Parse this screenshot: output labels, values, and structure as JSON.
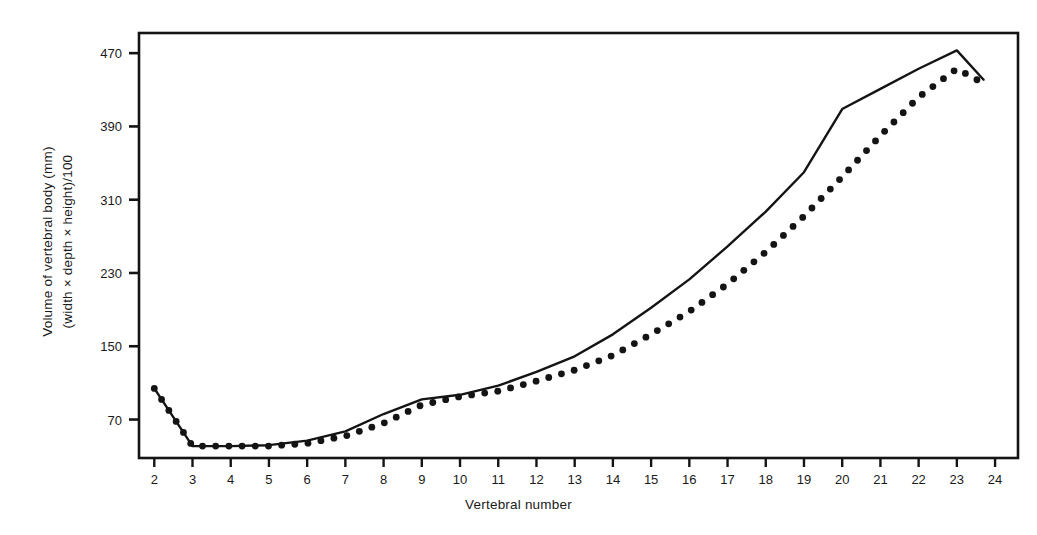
{
  "figure": {
    "background_color": "#ffffff",
    "ink_color": "#141414"
  },
  "axes": {
    "frame": {
      "left": 139,
      "top": 33,
      "right": 1018,
      "bottom": 458
    },
    "y_title_line1": "Volume of vertebral body (mm)",
    "y_title_line2": "(width × depth × height)/100",
    "x_title": "Vertebral number",
    "y_ticks": [
      470,
      390,
      310,
      230,
      150,
      70
    ],
    "y_tick_labels": [
      "470",
      "390",
      "310",
      "230",
      "150",
      "70"
    ],
    "x_ticks": [
      2,
      3,
      4,
      5,
      6,
      7,
      8,
      9,
      10,
      11,
      12,
      13,
      14,
      15,
      16,
      17,
      18,
      19,
      20,
      21,
      22,
      23,
      24
    ],
    "x_tick_labels": [
      "2",
      "3",
      "4",
      "5",
      "6",
      "7",
      "8",
      "9",
      "10",
      "11",
      "12",
      "13",
      "14",
      "15",
      "16",
      "17",
      "18",
      "19",
      "20",
      "21",
      "22",
      "23",
      "24"
    ]
  },
  "chart_data": {
    "type": "line",
    "title": "",
    "xlabel": "Vertebral number",
    "ylabel": "Volume of vertebral body (mm) (width × depth × height)/100",
    "xlim": [
      1.6,
      24.6
    ],
    "ylim": [
      28,
      492
    ],
    "grid": false,
    "legend": "none",
    "x": [
      2,
      3,
      4,
      5,
      6,
      7,
      8,
      9,
      10,
      11,
      12,
      13,
      14,
      15,
      16,
      17,
      18,
      19,
      20,
      21,
      22,
      23,
      23.7
    ],
    "series": [
      {
        "name": "solid-line",
        "style": "solid",
        "values": [
          104,
          41,
          41,
          42,
          47,
          57,
          76,
          92,
          97,
          107,
          122,
          139,
          163,
          192,
          223,
          259,
          297,
          340,
          409,
          431,
          453,
          473,
          441
        ]
      },
      {
        "name": "dotted-line",
        "style": "dotted",
        "values": [
          104,
          41,
          41,
          41,
          44,
          52,
          66,
          86,
          95,
          101,
          112,
          124,
          140,
          163,
          188,
          218,
          253,
          292,
          335,
          380,
          422,
          453,
          437
        ]
      }
    ]
  }
}
